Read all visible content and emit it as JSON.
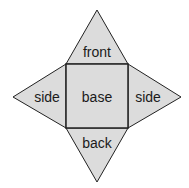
{
  "diagram": {
    "type": "square-pyramid-net",
    "fill": "#dcdcdc",
    "stroke": "#222222",
    "labels": {
      "front": "front",
      "left": "side",
      "base": "base",
      "right": "side",
      "back": "back"
    }
  }
}
